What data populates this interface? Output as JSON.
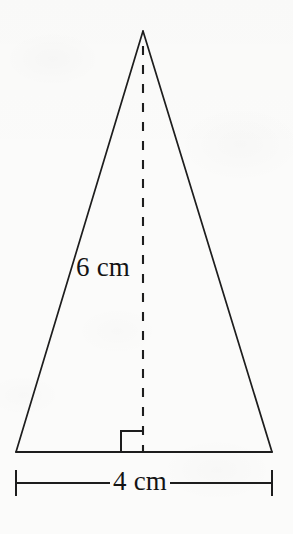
{
  "figure": {
    "type": "geometry-diagram",
    "shape": "isosceles-triangle",
    "background_color": "#fbfbfa",
    "ink_color": "#141414"
  },
  "labels": {
    "side_length": "6 cm",
    "base_length": "4 cm"
  },
  "measurements": {
    "slant_side_value": 6,
    "base_value": 4,
    "units": "cm"
  },
  "geometry": {
    "apex": {
      "x": 143,
      "y": 31
    },
    "base_left": {
      "x": 16,
      "y": 452
    },
    "base_right": {
      "x": 272,
      "y": 452
    },
    "altitude_foot": {
      "x": 143,
      "y": 452
    },
    "dimension_line_y": 483,
    "dimension_tick_top": 470,
    "dimension_tick_bottom": 496
  }
}
